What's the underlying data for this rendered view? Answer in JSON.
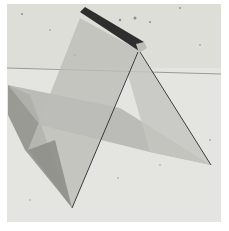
{
  "image": {
    "description": "Black-and-white photograph of a transparent folded-plane sculpture with a dark bar on top, casting shadows on a pale surface",
    "colors": {
      "background": "#e4e4e0",
      "wall_band": "#dcdcd7",
      "plane_light": "#c9c9c4",
      "plane_mid": "#a9a9a4",
      "plane_dark": "#8a8a86",
      "bar": "#2e2e2e",
      "edge": "#3a3a3a"
    }
  }
}
